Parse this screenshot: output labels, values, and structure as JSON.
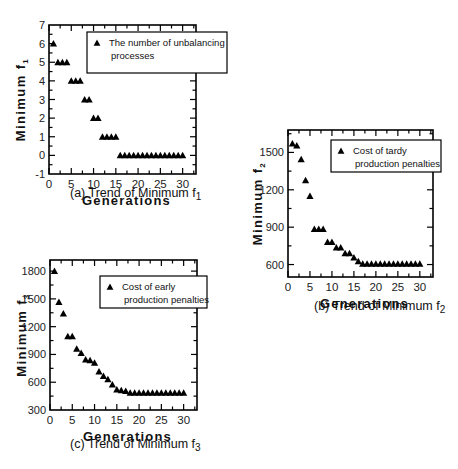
{
  "chart_data": [
    {
      "id": "a",
      "type": "scatter",
      "title": "(a) Trend of Minimum f1",
      "caption_prefix": "(a) Trend of Minimum f",
      "caption_sub": "1",
      "xlabel": "Generations",
      "ylabel": "Minimum f",
      "ylabel_sub": "1",
      "xlim": [
        0,
        33
      ],
      "ylim": [
        -1,
        7
      ],
      "xticks": [
        0,
        5,
        10,
        15,
        20,
        25,
        30
      ],
      "yticks": [
        -1,
        0,
        1,
        2,
        3,
        4,
        5,
        6,
        7
      ],
      "marker": "triangle",
      "grid": false,
      "legend": {
        "position": "upper right",
        "line1": "The number of unbalancing",
        "line2": "processes"
      },
      "series": [
        {
          "name": "The number of unbalancing processes",
          "x": [
            1,
            2,
            3,
            4,
            5,
            6,
            7,
            8,
            9,
            10,
            11,
            12,
            13,
            14,
            15,
            16,
            17,
            18,
            19,
            20,
            21,
            22,
            23,
            24,
            25,
            26,
            27,
            28,
            29,
            30
          ],
          "values": [
            6,
            5,
            5,
            5,
            4,
            4,
            4,
            3,
            3,
            2,
            2,
            1,
            1,
            1,
            1,
            0,
            0,
            0,
            0,
            0,
            0,
            0,
            0,
            0,
            0,
            0,
            0,
            0,
            0,
            0
          ]
        }
      ]
    },
    {
      "id": "b",
      "type": "scatter",
      "title": "(b) Trend of Minimum f2",
      "caption_prefix": "(b) Trend of Minimum f",
      "caption_sub": "2",
      "xlabel": "Generations",
      "ylabel": "Minimum f",
      "ylabel_sub": "2",
      "xlim": [
        0,
        33
      ],
      "ylim": [
        500,
        1680
      ],
      "xticks": [
        0,
        5,
        10,
        15,
        20,
        25,
        30
      ],
      "yticks": [
        600,
        900,
        1200,
        1500
      ],
      "marker": "triangle",
      "grid": false,
      "legend": {
        "position": "upper right",
        "line1": "Cost of tardy",
        "line2": "production penalties"
      },
      "series": [
        {
          "name": "Cost of tardy production penalties",
          "x": [
            1,
            2,
            3,
            4,
            5,
            6,
            7,
            8,
            9,
            10,
            11,
            12,
            13,
            14,
            15,
            16,
            17,
            18,
            19,
            20,
            21,
            22,
            23,
            24,
            25,
            26,
            27,
            28,
            29,
            30
          ],
          "values": [
            1570,
            1555,
            1445,
            1275,
            1150,
            885,
            885,
            885,
            780,
            780,
            735,
            735,
            690,
            690,
            655,
            625,
            605,
            605,
            605,
            605,
            605,
            605,
            605,
            605,
            605,
            605,
            605,
            605,
            605,
            605
          ]
        }
      ]
    },
    {
      "id": "c",
      "type": "scatter",
      "title": "(c) Trend of Minimum f3",
      "caption_prefix": "(c) Trend of Minimum f",
      "caption_sub": "3",
      "xlabel": "Generations",
      "ylabel": "Minimum f",
      "ylabel_sub": "3",
      "xlim": [
        0,
        33
      ],
      "ylim": [
        300,
        1920
      ],
      "xticks": [
        0,
        5,
        10,
        15,
        20,
        25,
        30
      ],
      "yticks": [
        300,
        600,
        900,
        1200,
        1500,
        1800
      ],
      "marker": "triangle",
      "grid": false,
      "legend": {
        "position": "upper right",
        "line1": "Cost of early",
        "line2": "production penalties"
      },
      "series": [
        {
          "name": "Cost of early production penalties",
          "x": [
            1,
            2,
            3,
            4,
            5,
            6,
            7,
            8,
            9,
            10,
            11,
            12,
            13,
            14,
            15,
            16,
            17,
            18,
            19,
            20,
            21,
            22,
            23,
            24,
            25,
            26,
            27,
            28,
            29,
            30
          ],
          "values": [
            1800,
            1465,
            1340,
            1095,
            1095,
            960,
            915,
            845,
            835,
            810,
            715,
            665,
            630,
            575,
            520,
            512,
            505,
            485,
            485,
            485,
            485,
            485,
            485,
            485,
            485,
            485,
            485,
            485,
            485,
            485
          ]
        }
      ]
    }
  ],
  "layout": {
    "a": {
      "box": [
        49,
        25,
        196,
        174
      ],
      "legend_box": [
        87,
        32,
        227,
        73
      ],
      "caption_xy": [
        70,
        194
      ],
      "xlabel_xy": [
        121,
        210
      ],
      "ylabel_x": 25
    },
    "b": {
      "box": [
        288,
        130,
        433,
        277
      ],
      "legend_box": [
        331,
        140,
        441,
        172
      ],
      "caption_xy": [
        315,
        307
      ],
      "xlabel_xy": [
        362,
        302
      ],
      "ylabel_x": 262
    },
    "c": {
      "box": [
        50,
        260,
        197,
        410
      ],
      "legend_box": [
        100,
        276,
        207,
        308
      ],
      "caption_xy": [
        70,
        445
      ],
      "xlabel_xy": [
        123,
        440
      ],
      "ylabel_x": 26
    }
  }
}
